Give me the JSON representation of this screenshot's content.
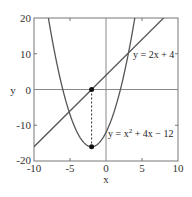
{
  "chart_data": {
    "type": "line",
    "title": "",
    "xlabel": "x",
    "ylabel": "y",
    "xlim": [
      -10,
      10
    ],
    "ylim": [
      -20,
      20
    ],
    "xticks": [
      -10,
      -5,
      0,
      5,
      10
    ],
    "yticks": [
      -20,
      -10,
      0,
      10,
      20
    ],
    "xtick_labels": [
      "-10",
      "-5",
      "0",
      "5",
      "10"
    ],
    "ytick_labels": [
      "-20",
      "-10",
      "0",
      "10",
      "20"
    ],
    "grid": false,
    "zero_lines": true,
    "legend": null,
    "series": [
      {
        "name": "y = 2x + 4",
        "kind": "line",
        "equation": {
          "type": "linear",
          "m": 2,
          "b": 4
        },
        "x": [
          -10,
          8
        ],
        "y": [
          -16,
          20
        ],
        "color": "#555555"
      },
      {
        "name": "y = x² + 4x − 12",
        "kind": "parabola",
        "equation": {
          "type": "quadratic",
          "a": 1,
          "b": 4,
          "c": -12
        },
        "x": [
          -8.9,
          -8,
          -6,
          -4,
          -2,
          0,
          2,
          4.9
        ],
        "y": [
          20,
          20,
          0,
          -12,
          -16,
          -12,
          0,
          20
        ],
        "color": "#555555"
      }
    ],
    "points": [
      {
        "x": -2,
        "y": 0,
        "label": ""
      },
      {
        "x": -2,
        "y": -16,
        "label": "vertex"
      }
    ],
    "guides": [
      {
        "type": "dashed-vertical",
        "x": -2,
        "y_from": 0,
        "y_to": -16
      }
    ],
    "annotations": [
      {
        "text": "y = 2x + 4",
        "x": 2.6,
        "y": 11.5
      },
      {
        "text_parts": [
          "y = x",
          "2",
          " + 4x − 12"
        ],
        "text": "y = x² + 4x − 12",
        "x": 0.2,
        "y": -11
      }
    ]
  },
  "labels": {
    "xlabel": "x",
    "ylabel": "y",
    "line_label": "y = 2x + 4",
    "parab_label_a": "y = x",
    "parab_label_sup": "2",
    "parab_label_b": " + 4x − 12",
    "xticks": [
      "-10",
      "-5",
      "0",
      "5",
      "10"
    ],
    "yticks": [
      "20",
      "10",
      "0",
      "-10",
      "-20"
    ]
  }
}
